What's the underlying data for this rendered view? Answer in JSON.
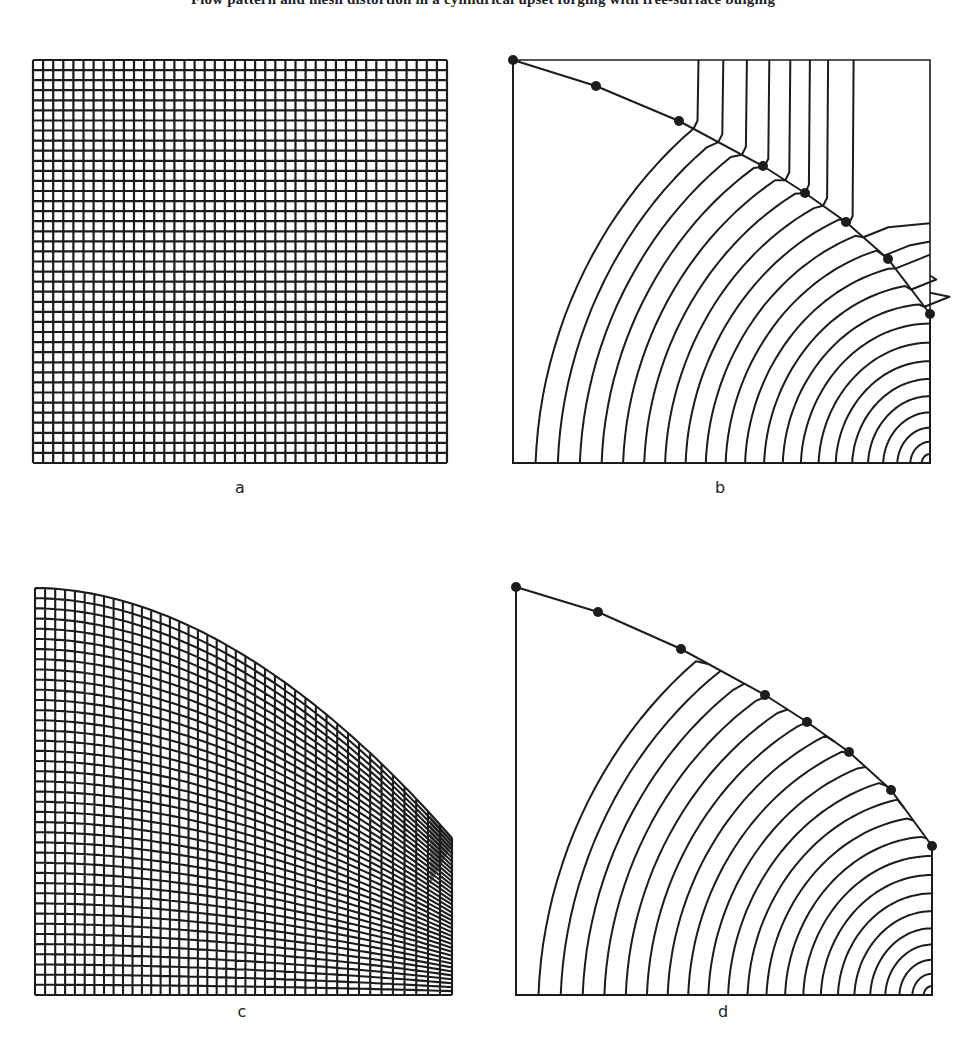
{
  "header": {
    "partial_caption": "mesh and flow patterns (partially cut off at top edge of page)"
  },
  "colors": {
    "ink": "#1c1c1c",
    "paper": "#ffffff"
  },
  "panels": [
    {
      "id": "a",
      "label": "a",
      "description": "Undeformed square grid mesh, about 41 × 40 cells"
    },
    {
      "id": "b",
      "label": "b",
      "description": "Flow lines with curved free surface and 8 marker dots; lines kink where they meet the surface"
    },
    {
      "id": "c",
      "label": "c",
      "description": "Deformed grid mesh beneath curved top boundary; cells compressed toward the right edge"
    },
    {
      "id": "d",
      "label": "d",
      "description": "Smooth concentric flow lines with curved free surface and 8 marker dots"
    }
  ],
  "chart_data": {
    "type": "diagram",
    "title": "",
    "panels": [
      {
        "label": "a",
        "kind": "grid",
        "cols": 41,
        "rows": 40,
        "bbox": [
          33,
          60,
          447,
          463
        ]
      },
      {
        "label": "b",
        "kind": "flowlines",
        "line_count": 22,
        "marker_dots": 8,
        "bbox": [
          513,
          60,
          930,
          463
        ],
        "surface_points": [
          [
            513,
            60
          ],
          [
            596,
            86
          ],
          [
            679,
            121
          ],
          [
            763,
            166
          ],
          [
            805,
            193
          ],
          [
            846,
            222
          ],
          [
            888,
            259
          ],
          [
            930,
            314
          ]
        ]
      },
      {
        "label": "c",
        "kind": "deformed-grid",
        "cols": 41,
        "rows": 40,
        "bbox": [
          35,
          588,
          452,
          995
        ]
      },
      {
        "label": "d",
        "kind": "flowlines",
        "line_count": 22,
        "marker_dots": 8,
        "bbox": [
          516,
          587,
          932,
          995
        ],
        "surface_points": [
          [
            516,
            587
          ],
          [
            598,
            612
          ],
          [
            681,
            649
          ],
          [
            765,
            695
          ],
          [
            807,
            722
          ],
          [
            849,
            752
          ],
          [
            891,
            790
          ],
          [
            932,
            846
          ]
        ]
      }
    ]
  }
}
